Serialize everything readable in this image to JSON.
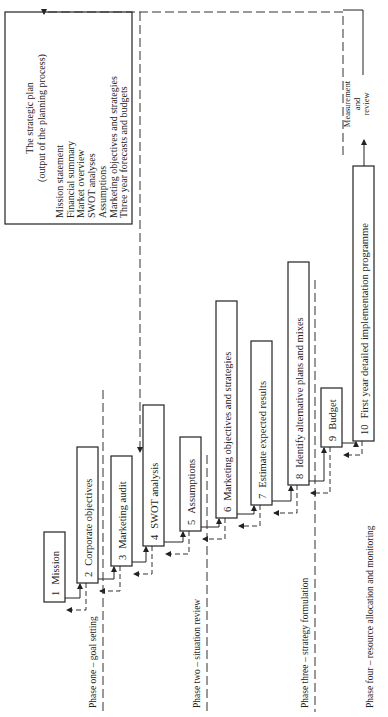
{
  "strategic_plan": {
    "title": "The strategic plan",
    "subtitle": "(output of the planning process)",
    "items": [
      "Mission statement",
      "Financial summary",
      "Market overview",
      "SWOT analyses",
      "Assumptions",
      "Marketing objectives and strategies",
      "Three year forecasts and budgets"
    ]
  },
  "steps": [
    {
      "number": "1",
      "label": "Mission"
    },
    {
      "number": "2",
      "label": "Corporate objectives"
    },
    {
      "number": "3",
      "label": "Marketing audit"
    },
    {
      "number": "4",
      "label": "SWOT analysis"
    },
    {
      "number": "5",
      "label": "Assumptions"
    },
    {
      "number": "6",
      "label": "Marketing objectives and strategies"
    },
    {
      "number": "7",
      "label": "Estimate expected results"
    },
    {
      "number": "8",
      "label": "Identify alternative plans and mixes"
    },
    {
      "number": "9",
      "label": "Budget"
    },
    {
      "number": "10",
      "label": "First year detailed implementation programme"
    }
  ],
  "phases": [
    "Phase one – goal setting",
    "Phase two – situation review",
    "Phase three – strategy formulation",
    "Phase four – resource allocation and monitoring"
  ],
  "measurement": [
    "Measurement",
    "and",
    "review"
  ]
}
